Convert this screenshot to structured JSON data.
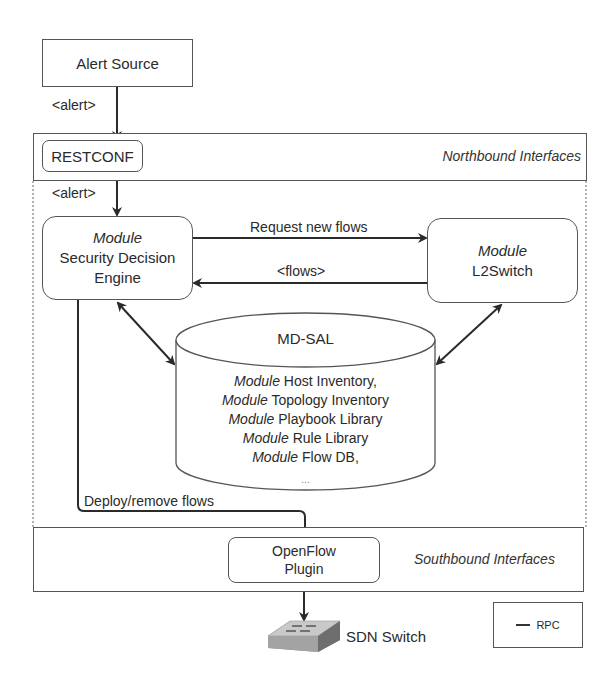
{
  "diagram": {
    "alert_source": {
      "label": "Alert Source"
    },
    "edges": {
      "alert_to_restconf": "<alert>",
      "restconf_to_engine": "<alert>",
      "request_new_flows": "Request new flows",
      "flows_back": "<flows>",
      "deploy_remove": "Deploy/remove flows"
    },
    "northbound": {
      "title": "Northbound Interfaces",
      "restconf": "RESTCONF"
    },
    "engine": {
      "prefix": "Module",
      "line1": "Security Decision",
      "line2": "Engine"
    },
    "l2switch": {
      "prefix": "Module",
      "name": "L2Switch"
    },
    "mdsal": {
      "title": "MD-SAL",
      "modules": [
        {
          "prefix": "Module",
          "name": "Host Inventory,"
        },
        {
          "prefix": "Module",
          "name": "Topology Inventory"
        },
        {
          "prefix": "Module",
          "name": "Playbook Library"
        },
        {
          "prefix": "Module",
          "name": "Rule Library"
        },
        {
          "prefix": "Module",
          "name": "Flow DB,"
        }
      ],
      "ellipsis": "..."
    },
    "southbound": {
      "title": "Southbound Interfaces",
      "openflow_line1": "OpenFlow",
      "openflow_line2": "Plugin"
    },
    "switch": {
      "label": "SDN Switch",
      "icon": "network-switch-icon"
    },
    "legend": {
      "label": "RPC"
    },
    "colors": {
      "line": "#333333",
      "border": "#555555",
      "background": "#ffffff"
    }
  }
}
